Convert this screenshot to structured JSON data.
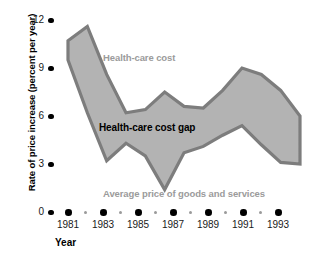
{
  "chart_data": {
    "type": "area",
    "title": "",
    "xlabel": "Year",
    "ylabel": "Rate of price increase (percent per year)",
    "x": [
      1981,
      1982,
      1983,
      1984,
      1985,
      1986,
      1987,
      1988,
      1989,
      1990,
      1991,
      1992,
      1993
    ],
    "xlim": [
      1980.6,
      1993.4
    ],
    "ylim": [
      0,
      12
    ],
    "yticks": [
      0,
      3,
      6,
      9,
      12
    ],
    "ytick_labels": [
      "0",
      "3",
      "6",
      "9",
      "12"
    ],
    "xticks_major": [
      1981,
      1983,
      1985,
      1987,
      1989,
      1991,
      1993
    ],
    "xtick_labels": [
      "1981",
      "1983",
      "1985",
      "1987",
      "1989",
      "1991",
      "1993"
    ],
    "xticks_minor": [
      1982,
      1984,
      1986,
      1988,
      1990,
      1992
    ],
    "grid": false,
    "legend_position": "in-plot-annotations",
    "series": [
      {
        "name": "Health-care cost",
        "role": "upper-bound",
        "values": [
          10.7,
          11.6,
          8.6,
          6.2,
          6.4,
          7.5,
          6.6,
          6.5,
          7.6,
          9.0,
          8.6,
          7.6,
          6.0
        ]
      },
      {
        "name": "Average price of goods and services",
        "role": "lower-bound",
        "values": [
          9.5,
          6.2,
          3.2,
          4.3,
          3.5,
          1.4,
          3.7,
          4.1,
          4.8,
          5.4,
          4.2,
          3.1,
          3.0
        ]
      }
    ],
    "band": {
      "name": "Health-care cost gap",
      "fill_color": "#b3b3b3",
      "border_color": "#7d7d7d",
      "values": [
        1.2,
        5.4,
        5.4,
        1.9,
        2.9,
        6.1,
        2.9,
        2.4,
        2.8,
        3.6,
        4.4,
        4.5,
        3.0
      ]
    },
    "annotations": [
      {
        "id": "upper",
        "text": "Health-care cost",
        "color": "#9b9b9b"
      },
      {
        "id": "gap",
        "text": "Health-care cost gap",
        "color": "#000000"
      },
      {
        "id": "lower",
        "text": "Average price of goods and services",
        "color": "#9b9b9b"
      }
    ]
  },
  "axes": {
    "y_title": "Rate of price increase (percent per year)",
    "x_title": "Year"
  },
  "colors": {
    "band_fill": "#b3b3b3",
    "band_border": "#7d7d7d",
    "tick": "#000000",
    "minor_tick": "#9a9a9a",
    "text": "#1a1a1a",
    "annotation_gray": "#9b9b9b",
    "background": "#ffffff"
  }
}
